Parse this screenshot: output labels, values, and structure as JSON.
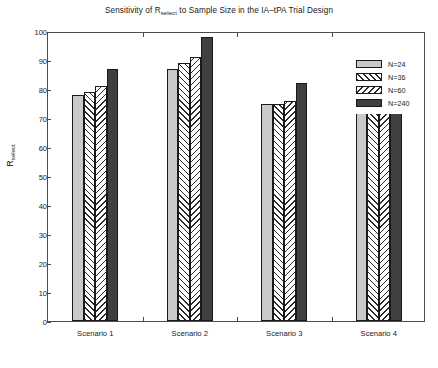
{
  "chart_data": {
    "type": "bar",
    "title_main_prefix": "Sensitivity of R",
    "title_subscript": "select",
    "title_main_suffix": " to Sample Size in the IA–tPA Trial Design",
    "xlabel": "",
    "ylabel": "R_select",
    "ylabel_main": "R",
    "ylabel_subscript": "select",
    "ylim": [
      0,
      100
    ],
    "ytick_step": 10,
    "yticks": [
      "0",
      "10",
      "20",
      "30",
      "40",
      "50",
      "60",
      "70",
      "80",
      "90",
      "100"
    ],
    "categories": [
      "Scenario 1",
      "Scenario 2",
      "Scenario 3",
      "Scenario 4"
    ],
    "grid": false,
    "legend_position": "upper right outside",
    "series": [
      {
        "name": "N=24",
        "values": [
          78,
          87,
          75,
          78
        ],
        "fill": "solid-light",
        "color": "#c9c9c9"
      },
      {
        "name": "N=36",
        "values": [
          79,
          89,
          75,
          82
        ],
        "fill": "forward-hatch",
        "color": "#ffffff"
      },
      {
        "name": "N=60",
        "values": [
          81,
          91,
          76,
          87
        ],
        "fill": "backward-hatch",
        "color": "#ffffff"
      },
      {
        "name": "N=240",
        "values": [
          87,
          98,
          82,
          91
        ],
        "fill": "solid-dark",
        "color": "#404040"
      }
    ]
  },
  "legend": {
    "items": [
      {
        "label": "N=24"
      },
      {
        "label": "N=36"
      },
      {
        "label": "N=60"
      },
      {
        "label": "N=240"
      }
    ]
  },
  "colors": {
    "axis": "#4d4d4d",
    "text": "#1a1a1a",
    "bar_light": "#c9c9c9",
    "bar_dark": "#404040",
    "background": "#ffffff"
  }
}
